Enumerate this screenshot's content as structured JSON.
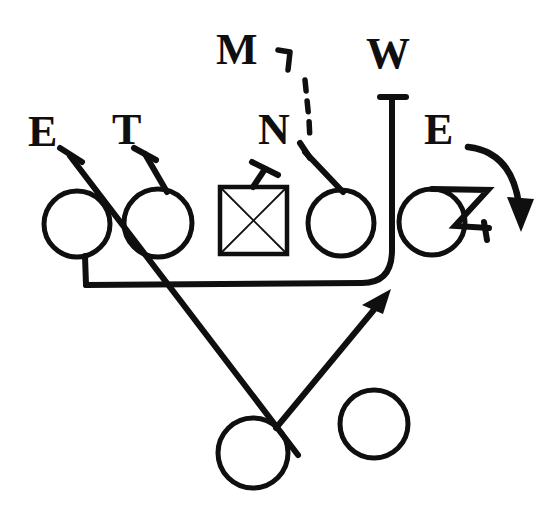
{
  "diagram": {
    "background_color": "#ffffff",
    "ink_color": "#100f0f",
    "width": 559,
    "height": 518,
    "labels": [
      {
        "id": "end-left",
        "text": "E",
        "x": 28,
        "y": 110,
        "role": "defensive-end-left"
      },
      {
        "id": "tackle",
        "text": "T",
        "x": 112,
        "y": 108,
        "role": "defensive-tackle"
      },
      {
        "id": "mike",
        "text": "M",
        "x": 216,
        "y": 28,
        "role": "mike-linebacker"
      },
      {
        "id": "nose",
        "text": "N",
        "x": 258,
        "y": 108,
        "role": "nose-tackle"
      },
      {
        "id": "will",
        "text": "W",
        "x": 366,
        "y": 32,
        "role": "will-linebacker"
      },
      {
        "id": "end-right",
        "text": "E",
        "x": 424,
        "y": 108,
        "role": "defensive-end-right"
      }
    ],
    "offense": {
      "linemen_circles": [
        {
          "id": "ol-1",
          "cx": 77,
          "cy": 224,
          "r": 33
        },
        {
          "id": "ol-2",
          "cx": 158,
          "cy": 223,
          "r": 34
        },
        {
          "id": "ol-4",
          "cx": 341,
          "cy": 223,
          "r": 33
        },
        {
          "id": "ol-5",
          "cx": 432,
          "cy": 222,
          "r": 33
        }
      ],
      "center_square": {
        "id": "center",
        "x": 220,
        "y": 187,
        "size": 67,
        "has_x_fill": true
      },
      "backs": [
        {
          "id": "back-left",
          "cx": 253,
          "cy": 453,
          "r": 35
        },
        {
          "id": "back-right",
          "cx": 374,
          "cy": 424,
          "r": 34
        }
      ]
    },
    "marks": {
      "end_left_tick": "short-hook-tick",
      "tackle_tick": "short-hook-tick",
      "nose_tick": "short-hook-tick",
      "mike_tick": "small-hook-glyph",
      "mike_path": "dashed-drop-line",
      "will_path": "blitz-path-with-tee-top",
      "end_right_path": "curved-arrow-down-right",
      "z_hook": "contain-z-hook",
      "cross_lines": "two-crossing-back-paths",
      "arrow_head": "solid-arrowhead-up-right"
    }
  }
}
